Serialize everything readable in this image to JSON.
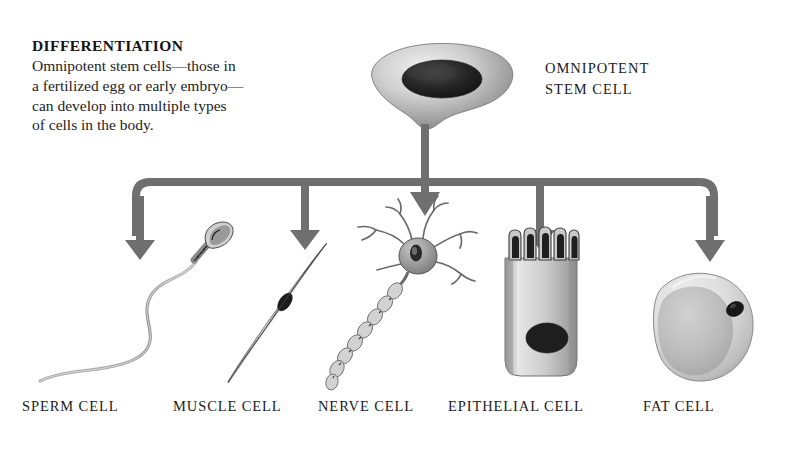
{
  "figure": {
    "heading": "DIFFERENTIATION",
    "description": "Omnipotent stem cells—those in a fertilized egg or early embryo— can develop into multiple types of cells in the body.",
    "description_lines": [
      "Omnipotent stem cells—those in",
      "a fertilized egg or early embryo—",
      "can develop into multiple types",
      "of cells in the body."
    ],
    "background_color": "#ffffff",
    "ink_color": "#1a1a1a"
  },
  "source_node": {
    "label_lines": [
      "OMNIPOTENT",
      "STEM CELL"
    ],
    "label": "OMNIPOTENT STEM CELL",
    "icon": "stem-cell-icon"
  },
  "flow": {
    "type": "one-to-many-branch",
    "stem_arrow": "vertical-stem-connector",
    "distribution_bar": "horizontal-distribution-bar",
    "branch_count": 5
  },
  "cells": [
    {
      "id": "sperm",
      "label": "SPERM CELL",
      "icon": "sperm-cell-icon",
      "arrow_x": 140,
      "label_x": 22,
      "label_y": 398
    },
    {
      "id": "muscle",
      "label": "MUSCLE CELL",
      "icon": "muscle-cell-icon",
      "arrow_x": 305,
      "label_x": 173,
      "label_y": 398
    },
    {
      "id": "nerve",
      "label": "NERVE CELL",
      "icon": "nerve-cell-icon",
      "arrow_x": 425,
      "label_x": 318,
      "label_y": 398
    },
    {
      "id": "epithelial",
      "label": "EPITHELIAL CELL",
      "icon": "epithelial-cell-icon",
      "arrow_x": 540,
      "label_x": 448,
      "label_y": 398
    },
    {
      "id": "fat",
      "label": "FAT CELL",
      "icon": "fat-cell-icon",
      "arrow_x": 710,
      "label_x": 643,
      "label_y": 398
    }
  ],
  "colors": {
    "arrow": "#6f6f6f",
    "cell_fill_light": "#d8d8d8",
    "cell_fill_mid": "#b4b4b4",
    "nucleus": "#1c1c1c",
    "outline": "#6a6a6a"
  }
}
